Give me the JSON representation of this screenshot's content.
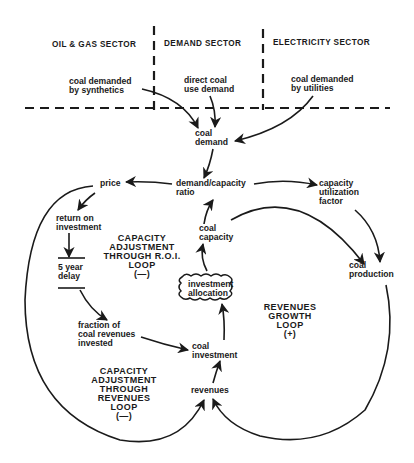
{
  "sectors": {
    "oil_gas": "OIL & GAS SECTOR",
    "demand": "DEMAND SECTOR",
    "electricity": "ELECTRICITY SECTOR"
  },
  "nodes": {
    "coal_demanded_synthetics": [
      "coal demanded",
      "by synthetics"
    ],
    "direct_coal_use_demand": [
      "direct coal",
      "use demand"
    ],
    "coal_demanded_utilities": [
      "coal demanded",
      "by utilities"
    ],
    "coal_demand": [
      "coal",
      "demand"
    ],
    "demand_capacity_ratio": [
      "demand/capacity",
      "ratio"
    ],
    "price": [
      "price"
    ],
    "return_on_investment": [
      "return on",
      "investment"
    ],
    "five_year_delay": [
      "5 year",
      "delay"
    ],
    "fraction_invested": [
      "fraction of",
      "coal revenues",
      "invested"
    ],
    "coal_investment": [
      "coal",
      "investment"
    ],
    "investment_allocation": [
      "investment",
      "allocation"
    ],
    "coal_capacity": [
      "coal",
      "capacity"
    ],
    "capacity_utilization_factor": [
      "capacity",
      "utilization",
      "factor"
    ],
    "coal_production": [
      "coal",
      "production"
    ],
    "revenues": [
      "revenues"
    ]
  },
  "loops": {
    "roi_loop": [
      "CAPACITY",
      "ADJUSTMENT",
      "THROUGH R.O.I.",
      "LOOP",
      "(—)"
    ],
    "revenues_adjust_loop": [
      "CAPACITY",
      "ADJUSTMENT",
      "THROUGH",
      "REVENUES",
      "LOOP",
      "(—)"
    ],
    "revenues_growth_loop": [
      "REVENUES",
      "GROWTH",
      "LOOP",
      "(+)"
    ]
  },
  "edges": [
    {
      "from": "coal_demanded_synthetics",
      "to": "coal_demand"
    },
    {
      "from": "direct_coal_use_demand",
      "to": "coal_demand"
    },
    {
      "from": "coal_demanded_utilities",
      "to": "coal_demand"
    },
    {
      "from": "coal_demand",
      "to": "demand_capacity_ratio"
    },
    {
      "from": "demand_capacity_ratio",
      "to": "price"
    },
    {
      "from": "demand_capacity_ratio",
      "to": "capacity_utilization_factor"
    },
    {
      "from": "price",
      "to": "return_on_investment"
    },
    {
      "from": "return_on_investment",
      "to": "five_year_delay"
    },
    {
      "from": "five_year_delay",
      "to": "fraction_invested"
    },
    {
      "from": "fraction_invested",
      "to": "coal_investment"
    },
    {
      "from": "coal_investment",
      "to": "investment_allocation"
    },
    {
      "from": "investment_allocation",
      "to": "coal_capacity"
    },
    {
      "from": "coal_capacity",
      "to": "demand_capacity_ratio"
    },
    {
      "from": "coal_capacity",
      "to": "coal_production"
    },
    {
      "from": "capacity_utilization_factor",
      "to": "coal_production"
    },
    {
      "from": "coal_production",
      "to": "revenues"
    },
    {
      "from": "price",
      "to": "revenues"
    },
    {
      "from": "revenues",
      "to": "coal_investment"
    }
  ]
}
